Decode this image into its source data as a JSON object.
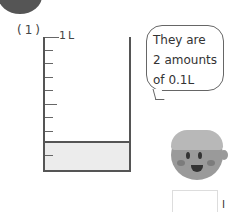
{
  "question": {
    "number_label": "(1)"
  },
  "beaker": {
    "top_label": "1L",
    "divisions": 10,
    "filled_divisions": 2,
    "fill_color": "#ececec",
    "outline_color": "#555555"
  },
  "speech_bubble": {
    "lines": [
      "They are",
      "2 amounts",
      "of 0.1L"
    ]
  },
  "answer": {
    "unit": "l"
  }
}
